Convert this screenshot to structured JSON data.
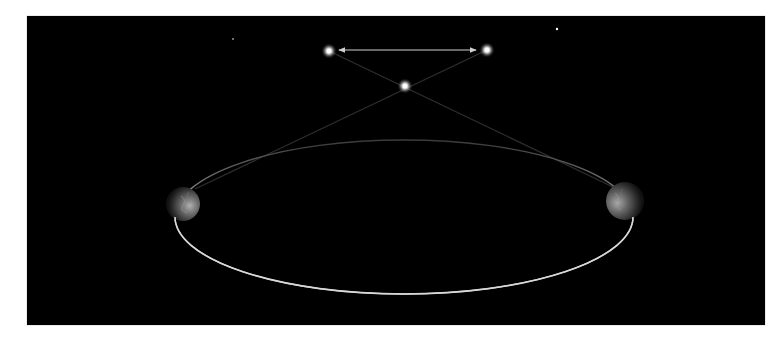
{
  "diagram": {
    "colors": {
      "background": "#000000",
      "page": "#ffffff",
      "orbit": "#d8d8d8",
      "orbit_far": "#3a3a3a",
      "sight_line": "#2e2e2e",
      "arrow": "#cfcfcf",
      "star_glow": "#ffffff"
    },
    "frame": {
      "x": 27,
      "y": 16,
      "width": 738,
      "height": 309
    },
    "orbit": {
      "cx": 404,
      "cy": 217,
      "rx": 229,
      "ry": 77
    },
    "earths": [
      {
        "name": "earth-left",
        "cx": 183,
        "cy": 204,
        "r": 17,
        "lit_side": "right"
      },
      {
        "name": "earth-right",
        "cx": 625,
        "cy": 201,
        "r": 19,
        "lit_side": "left"
      }
    ],
    "stars": [
      {
        "name": "apparent-position-left",
        "cx": 329,
        "cy": 51,
        "r": 5
      },
      {
        "name": "apparent-position-right",
        "cx": 487,
        "cy": 50,
        "r": 5
      },
      {
        "name": "nearby-star",
        "cx": 405,
        "cy": 86,
        "r": 5
      }
    ],
    "background_stars": [
      {
        "cx": 557,
        "cy": 29,
        "r": 1.2
      },
      {
        "cx": 233,
        "cy": 39,
        "r": 0.8
      }
    ],
    "sight_lines": [
      {
        "from": [
          195,
          189
        ],
        "to": [
          487,
          50
        ]
      },
      {
        "from": [
          613,
          187
        ],
        "to": [
          329,
          51
        ]
      }
    ],
    "parallax_arrow": {
      "x1": 339,
      "x2": 476,
      "y": 50
    }
  }
}
